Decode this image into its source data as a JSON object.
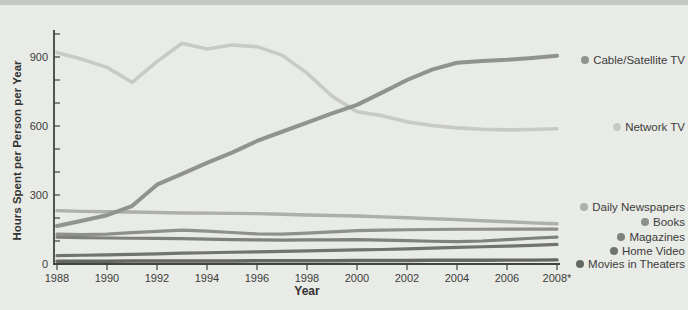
{
  "chart_data": {
    "type": "line",
    "title": "",
    "xlabel": "Year",
    "ylabel": "Hours Spent per Person per Year",
    "xlim": [
      1988,
      2008
    ],
    "ylim": [
      0,
      1000
    ],
    "grid": false,
    "legend_position": "right",
    "x": [
      1988,
      1989,
      1990,
      1991,
      1992,
      1993,
      1994,
      1995,
      1996,
      1997,
      1998,
      1999,
      2000,
      2001,
      2002,
      2003,
      2004,
      2005,
      2006,
      2007,
      2008
    ],
    "x_tick_years": [
      1988,
      1990,
      1992,
      1994,
      1996,
      1998,
      2000,
      2002,
      2004,
      2006,
      2008
    ],
    "x_tick_labels": [
      "1988",
      "1990",
      "1992",
      "1994",
      "1996",
      "1998",
      "2000",
      "2002",
      "2004",
      "2006",
      "2008*"
    ],
    "y_tick_values": [
      0,
      300,
      600,
      900
    ],
    "y_tick_labels": [
      "0",
      "300",
      "600",
      "900"
    ],
    "y_minor_tick_step": 100,
    "series": [
      {
        "id": "cable-satellite-tv",
        "name": "Cable/Satellite TV",
        "color": "#919390",
        "width": 4,
        "values": [
          165,
          188,
          212,
          252,
          345,
          392,
          440,
          484,
          535,
          575,
          615,
          655,
          692,
          745,
          800,
          845,
          875,
          883,
          888,
          896,
          905
        ]
      },
      {
        "id": "network-tv",
        "name": "Network TV",
        "color": "#c8cac5",
        "width": 3.6,
        "values": [
          920,
          890,
          855,
          790,
          880,
          960,
          935,
          952,
          945,
          908,
          830,
          730,
          662,
          645,
          618,
          602,
          592,
          586,
          583,
          585,
          588
        ]
      },
      {
        "id": "daily-newspapers",
        "name": "Daily Newspapers",
        "color": "#adafaa",
        "width": 3.4,
        "values": [
          232,
          229,
          227,
          226,
          224,
          222,
          221,
          220,
          219,
          216,
          213,
          211,
          209,
          205,
          201,
          197,
          193,
          188,
          184,
          179,
          175
        ]
      },
      {
        "id": "books",
        "name": "Books",
        "color": "#8e908b",
        "width": 3.2,
        "values": [
          130,
          128,
          130,
          136,
          142,
          147,
          143,
          137,
          131,
          130,
          134,
          140,
          145,
          147,
          149,
          150,
          151,
          151,
          152,
          152,
          152
        ]
      },
      {
        "id": "magazines",
        "name": "Magazines",
        "color": "#7f817c",
        "width": 3.2,
        "values": [
          117,
          115,
          113,
          112,
          111,
          110,
          108,
          106,
          105,
          104,
          105,
          105,
          106,
          104,
          102,
          99,
          97,
          100,
          106,
          112,
          117
        ]
      },
      {
        "id": "home-video",
        "name": "Home Video",
        "color": "#717370",
        "width": 3.2,
        "values": [
          36,
          38,
          40,
          42,
          44,
          47,
          49,
          51,
          53,
          55,
          57,
          59,
          61,
          63,
          66,
          69,
          72,
          75,
          78,
          81,
          85
        ]
      },
      {
        "id": "movies-in-theaters",
        "name": "Movies in Theaters",
        "color": "#656763",
        "width": 3.4,
        "values": [
          12,
          12,
          12,
          13,
          13,
          13,
          13,
          13,
          14,
          14,
          14,
          14,
          15,
          15,
          15,
          16,
          16,
          16,
          17,
          17,
          18
        ]
      }
    ]
  }
}
